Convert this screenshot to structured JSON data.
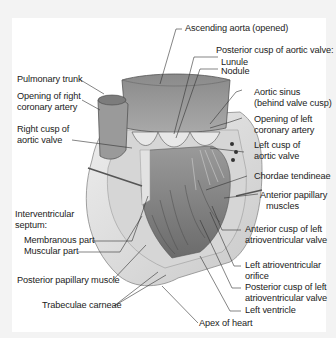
{
  "figure": {
    "colors": {
      "background": "#f3f3f3",
      "panel": "#ffffff",
      "text": "#222222",
      "leader_line": "#333333",
      "tissue_light": "#e6e6e6",
      "tissue_mid": "#b9b9b9",
      "tissue_dark": "#6e6e6e"
    }
  },
  "labels": {
    "ascending_aorta": "Ascending aorta (opened)",
    "posterior_cusp_heading": "Posterior cusp of aortic valve:",
    "lunule": "Lunule",
    "nodule": "Nodule",
    "pulmonary_trunk": "Pulmonary trunk",
    "opening_right_coronary_1": "Opening of right",
    "opening_right_coronary_2": "coronary artery",
    "aortic_sinus_1": "Aortic sinus",
    "aortic_sinus_2": "(behind valve cusp)",
    "opening_left_coronary_1": "Opening of left",
    "opening_left_coronary_2": "coronary artery",
    "right_cusp_1": "Right cusp of",
    "right_cusp_2": "aortic valve",
    "left_cusp_1": "Left cusp of",
    "left_cusp_2": "aortic valve",
    "chordae_tendineae": "Chordae tendineae",
    "anterior_papillary_1": "Anterior papillary",
    "anterior_papillary_2": "muscles",
    "interventricular_1": "Interventricular",
    "interventricular_2": "septum:",
    "membranous_part": "Membranous part",
    "muscular_part": "Muscular part",
    "anterior_cusp_left_av_1": "Anterior cusp of left",
    "anterior_cusp_left_av_2": "atrioventricular valve",
    "left_av_orifice_1": "Left atrioventricular",
    "left_av_orifice_2": "orifice",
    "posterior_papillary": "Posterior papillary muscle",
    "posterior_cusp_left_av_1": "Posterior cusp of left",
    "posterior_cusp_left_av_2": "atrioventricular valve",
    "trabeculae_carneae": "Trabeculae carneae",
    "left_ventricle": "Left ventricle",
    "apex_of_heart": "Apex of heart"
  }
}
